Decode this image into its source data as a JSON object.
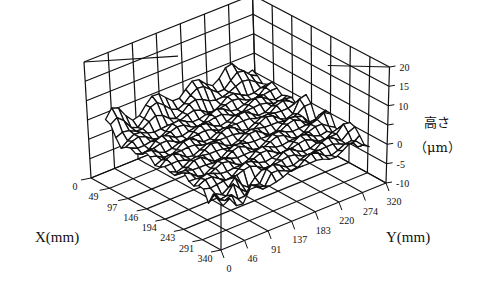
{
  "chart_data": {
    "type": "surface3d",
    "title": "",
    "xlabel": "X(mm)",
    "ylabel": "Y(mm)",
    "zlabel_line1": "高さ",
    "zlabel_line2": "（μm）",
    "x_ticks": [
      "0",
      "49",
      "97",
      "146",
      "194",
      "243",
      "291",
      "340"
    ],
    "y_ticks": [
      "0",
      "46",
      "91",
      "137",
      "183",
      "220",
      "274",
      "320"
    ],
    "z_ticks": [
      "20",
      "15",
      "10",
      "",
      "0",
      "-5",
      "-10"
    ],
    "z_tick_values": [
      20,
      15,
      10,
      5,
      0,
      -5,
      -10
    ],
    "xlim": [
      0,
      340
    ],
    "ylim": [
      0,
      320
    ],
    "zlim": [
      -10,
      20
    ],
    "grid": true,
    "surface_grid": {
      "nx": 24,
      "ny": 22
    },
    "surface_description": "Mostly flat surface around 0 to 2 μm with a raised ridge near X=0 (back-left edge, up to ~8 μm) and small dips/bumps near the X=340 edge (front) and Y=320 edge (right), range approximately -3 to 9 μm"
  },
  "labels": {
    "x_axis_title": "X(mm)",
    "y_axis_title": "Y(mm)",
    "z_axis_title_1": "高さ",
    "z_axis_title_2": "（μm）"
  }
}
